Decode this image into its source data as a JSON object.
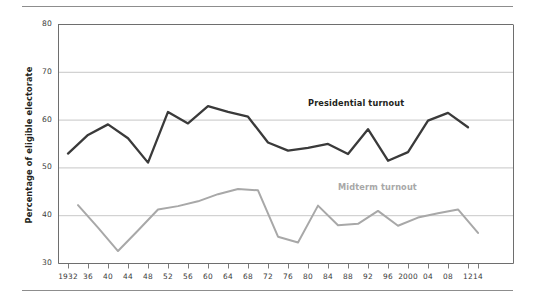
{
  "chart_data": {
    "type": "line",
    "title": "",
    "subtitle": "",
    "xlabel": "",
    "ylabel": "Percentage of eligible electorate",
    "xlim": [
      1932,
      2014
    ],
    "ylim": [
      30,
      80
    ],
    "y_ticks": [
      30,
      40,
      50,
      60,
      70,
      80
    ],
    "y_tick_labels": [
      "30",
      "40",
      "50",
      "60",
      "70",
      "80"
    ],
    "grid": true,
    "grid_axis": "y",
    "legend_position": "inline-annotation",
    "x_tick_values": [
      1932,
      1936,
      1940,
      1944,
      1948,
      1952,
      1956,
      1960,
      1964,
      1968,
      1972,
      1976,
      1980,
      1984,
      1988,
      1992,
      1996,
      2000,
      2004,
      2008,
      2012,
      2014
    ],
    "x_tick_labels": [
      "1932",
      "36",
      "40",
      "44",
      "48",
      "52",
      "56",
      "60",
      "64",
      "68",
      "72",
      "76",
      "80",
      "84",
      "88",
      "92",
      "96",
      "2000",
      "04",
      "08",
      "12",
      "14"
    ],
    "series": [
      {
        "name": "Presidential turnout",
        "color": "#3a3a3a",
        "label_color": "#231f20",
        "x": [
          1932,
          1936,
          1940,
          1944,
          1948,
          1952,
          1956,
          1960,
          1964,
          1968,
          1972,
          1976,
          1980,
          1984,
          1988,
          1992,
          1996,
          2000,
          2004,
          2008,
          2012
        ],
        "values": [
          52.9,
          56.8,
          59.0,
          56.1,
          51.0,
          61.6,
          59.2,
          62.8,
          61.6,
          60.6,
          55.2,
          53.5,
          54.1,
          54.9,
          52.8,
          58.0,
          51.4,
          53.2,
          59.8,
          61.4,
          58.4
        ]
      },
      {
        "name": "Midterm turnout",
        "color": "#a8a8a8",
        "label_color": "#a8a8a8",
        "x": [
          1934,
          1938,
          1942,
          1946,
          1950,
          1954,
          1958,
          1962,
          1966,
          1970,
          1974,
          1978,
          1982,
          1986,
          1990,
          1994,
          1998,
          2002,
          2006,
          2010,
          2014
        ],
        "values": [
          42.1,
          37.4,
          32.5,
          36.8,
          41.2,
          41.9,
          42.9,
          44.4,
          45.5,
          45.2,
          35.5,
          34.3,
          42.0,
          37.9,
          38.2,
          40.9,
          37.8,
          39.5,
          40.4,
          41.2,
          36.3
        ]
      }
    ],
    "annotations": [
      {
        "text": "Presidential turnout",
        "x": 1980,
        "y": 63.5,
        "color": "#231f20"
      },
      {
        "text": "Midterm turnout",
        "x": 1986,
        "y": 46.0,
        "color": "#a8a8a8"
      }
    ]
  },
  "axis": {
    "ylabel": "Percentage of eligible electorate"
  }
}
